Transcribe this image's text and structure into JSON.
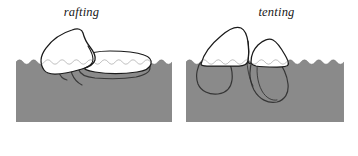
{
  "figure": {
    "name": "sea-ice-deformation-diagram",
    "background_color": "#ffffff",
    "width": 358,
    "height": 156,
    "panel_count": 2
  },
  "style": {
    "water_fill": "#8a8a8a",
    "ink_color": "#1a1a1a",
    "label_color": "#171717",
    "outline_width": 1.2,
    "waterline_width": 0.9
  },
  "panels": [
    {
      "id": "rafting",
      "label": "rafting",
      "description": "One ice floe rides up over and overlaps the adjacent floe",
      "water": {
        "left": 16,
        "top": 62,
        "right": 172,
        "bottom": 122,
        "scallop_count": 22,
        "scallop_amplitude": 2.2
      },
      "floes": [
        {
          "name": "upper-overriding-floe",
          "role": "overriding",
          "tilt": "up-right",
          "submerged": false
        },
        {
          "name": "lower-overridden-floe",
          "role": "overridden",
          "tilt": "flat",
          "submerged": true
        }
      ]
    },
    {
      "id": "tenting",
      "label": "tenting",
      "description": "Two ice floes buckle upward against each other forming a tent-shaped ridge",
      "water": {
        "left": 7,
        "top": 62,
        "right": 165,
        "bottom": 122,
        "scallop_count": 22,
        "scallop_amplitude": 2.2
      },
      "floes": [
        {
          "name": "left-tenting-floe",
          "role": "uplifted-left",
          "tilt": "up-right",
          "submerged": true
        },
        {
          "name": "right-tenting-floe",
          "role": "uplifted-right",
          "tilt": "up-left",
          "submerged": true
        }
      ]
    }
  ]
}
